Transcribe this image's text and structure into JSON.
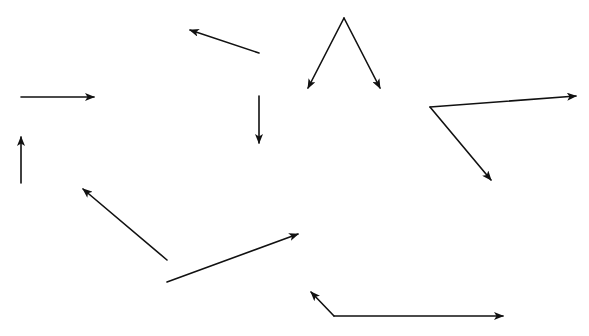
{
  "diagram": {
    "stroke_color": "#111111",
    "background": "#ffffff",
    "arrows": [
      {
        "id": "a1",
        "from": [
          21,
          97
        ],
        "to": [
          94,
          97
        ]
      },
      {
        "id": "a2",
        "from": [
          259,
          53
        ],
        "to": [
          190,
          30
        ]
      },
      {
        "id": "a3",
        "from": [
          259,
          96
        ],
        "to": [
          259,
          143
        ]
      },
      {
        "id": "a4",
        "from": [
          21,
          183
        ],
        "to": [
          21,
          137
        ]
      },
      {
        "id": "a5",
        "from": [
          344,
          18
        ],
        "to": [
          308,
          88
        ]
      },
      {
        "id": "a6",
        "from": [
          344,
          18
        ],
        "to": [
          380,
          88
        ]
      },
      {
        "id": "a7",
        "from": [
          430,
          107
        ],
        "to": [
          576,
          96
        ]
      },
      {
        "id": "a8",
        "from": [
          430,
          107
        ],
        "to": [
          491,
          180
        ]
      },
      {
        "id": "a9",
        "from": [
          167,
          260
        ],
        "to": [
          83,
          189
        ]
      },
      {
        "id": "a10",
        "from": [
          167,
          282
        ],
        "to": [
          298,
          234
        ]
      },
      {
        "id": "a11",
        "from": [
          334,
          316
        ],
        "to": [
          311,
          292
        ]
      },
      {
        "id": "a12",
        "from": [
          334,
          316
        ],
        "to": [
          503,
          316
        ]
      }
    ]
  }
}
